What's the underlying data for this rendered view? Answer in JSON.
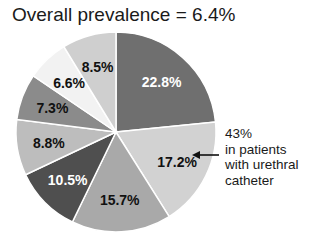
{
  "chart_data": {
    "type": "pie",
    "title": "Overall prevalence = 6.4%",
    "start_angle_deg": 0,
    "direction": "clockwise",
    "slices": [
      {
        "label": "22.8%",
        "value": 22.8,
        "color": "#6f6f6f",
        "text_color": "#ffffff"
      },
      {
        "label": "17.2%",
        "value": 17.2,
        "color": "#d2d2d2",
        "text_color": "#111111"
      },
      {
        "label": "15.7%",
        "value": 15.7,
        "color": "#a9a9a9",
        "text_color": "#111111"
      },
      {
        "label": "10.5%",
        "value": 10.5,
        "color": "#4f4f4f",
        "text_color": "#ffffff"
      },
      {
        "label": "8.8%",
        "value": 8.8,
        "color": "#bdbdbd",
        "text_color": "#111111"
      },
      {
        "label": "7.3%",
        "value": 7.3,
        "color": "#8b8b8b",
        "text_color": "#111111"
      },
      {
        "label": "6.6%",
        "value": 6.6,
        "color": "#f2f2f2",
        "text_color": "#111111"
      },
      {
        "label": "8.5%",
        "value": 8.5,
        "color": "#cfcfcf",
        "text_color": "#111111"
      }
    ],
    "annotation": {
      "target_slice": "17.2%",
      "lines": [
        "43%",
        "in patients",
        "with urethral",
        "catheter"
      ]
    }
  },
  "header": {
    "title": "Overall prevalence = 6.4%"
  },
  "annotation": {
    "line1": "43%",
    "line2": "in patients",
    "line3": "with urethral",
    "line4": "catheter"
  }
}
